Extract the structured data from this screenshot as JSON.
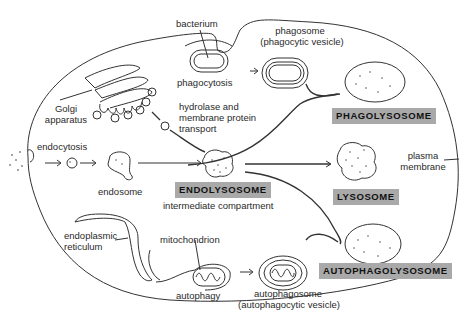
{
  "diagram": {
    "labels": {
      "bacterium": "bacterium",
      "phagocytosis": "phagocytosis",
      "phagosome": "phagosome",
      "phagosome_sub": "(phagocytic vesicle)",
      "golgi_1": "Golgi",
      "golgi_2": "apparatus",
      "hydrolase_1": "hydrolase and",
      "hydrolase_2": "membrane protein",
      "hydrolase_3": "transport",
      "endocytosis": "endocytosis",
      "endosome": "endosome",
      "intermediate": "intermediate compartment",
      "plasma_1": "plasma",
      "plasma_2": "membrane",
      "er_1": "endoplasmic",
      "er_2": "reticulum",
      "mitochondrion": "mitochondrion",
      "autophagy": "autophagy",
      "autophagosome": "autophagosome",
      "autophagosome_sub": "(autophagocytic vesicle)"
    },
    "boxes": {
      "phagolysosome": "PHAGOLYSOSOME",
      "endolysosome": "ENDOLYSOSOME",
      "lysosome": "LYSOSOME",
      "autophagolysosome": "AUTOPHAGOLYSOSOME"
    },
    "colors": {
      "box_fill": "#a9a9a9",
      "line": "#333333"
    }
  }
}
